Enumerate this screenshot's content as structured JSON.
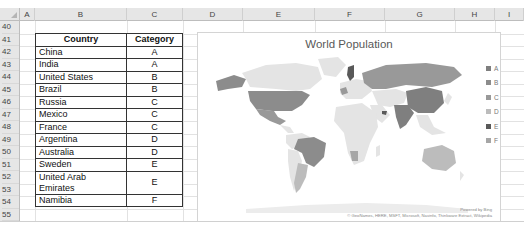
{
  "spreadsheet": {
    "columns": [
      {
        "label": "A",
        "left": 20,
        "width": 15
      },
      {
        "label": "B",
        "left": 35,
        "width": 92
      },
      {
        "label": "C",
        "left": 127,
        "width": 56
      },
      {
        "label": "D",
        "left": 183,
        "width": 60
      },
      {
        "label": "E",
        "left": 243,
        "width": 72
      },
      {
        "label": "F",
        "left": 315,
        "width": 70
      },
      {
        "label": "G",
        "left": 385,
        "width": 70
      },
      {
        "label": "H",
        "left": 455,
        "width": 40
      },
      {
        "label": "I",
        "left": 495,
        "width": 29
      }
    ],
    "rows": [
      "40",
      "41",
      "42",
      "43",
      "44",
      "45",
      "46",
      "47",
      "48",
      "49",
      "50",
      "51",
      "52",
      "53",
      "54",
      "55"
    ]
  },
  "table": {
    "headers": {
      "country": "Country",
      "category": "Category"
    },
    "rows": [
      {
        "country": "China",
        "category": "A"
      },
      {
        "country": "India",
        "category": "A"
      },
      {
        "country": "United States",
        "category": "B"
      },
      {
        "country": "Brazil",
        "category": "B"
      },
      {
        "country": "Russia",
        "category": "C"
      },
      {
        "country": "Mexico",
        "category": "C"
      },
      {
        "country": "France",
        "category": "C"
      },
      {
        "country": "Argentina",
        "category": "D"
      },
      {
        "country": "Australia",
        "category": "D"
      },
      {
        "country": "Sweden",
        "category": "E"
      },
      {
        "country": "United Arab Emirates",
        "category": "E"
      },
      {
        "country": "Namibia",
        "category": "F"
      }
    ]
  },
  "chart": {
    "title": "World Population",
    "legend": [
      {
        "label": "A",
        "color": "#7f7f7f"
      },
      {
        "label": "B",
        "color": "#8c8c8c"
      },
      {
        "label": "C",
        "color": "#999999"
      },
      {
        "label": "D",
        "color": "#bcbcbc"
      },
      {
        "label": "E",
        "color": "#595959"
      },
      {
        "label": "F",
        "color": "#a6a6a6"
      }
    ],
    "powered_by": "Powered by Bing",
    "attribution": "© GeoNames, HERE, MSFT, Microsoft, Navinfo, Thinkware Extract, Wikipedia"
  },
  "colors": {
    "land_default": "#e4e4e4",
    "cat_A": "#7f7f7f",
    "cat_B": "#8c8c8c",
    "cat_C": "#999999",
    "cat_D": "#bcbcbc",
    "cat_E": "#595959",
    "cat_F": "#a6a6a6"
  }
}
